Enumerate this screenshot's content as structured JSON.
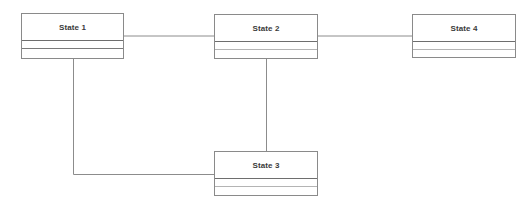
{
  "diagram": {
    "type": "state-diagram",
    "colors": {
      "border": "#8a8a8a",
      "connector": "#8c8c8c",
      "title_text": "#3a3a3a",
      "background": "#ffffff"
    },
    "states": [
      {
        "id": "state1",
        "label": "State 1",
        "x": 21,
        "y": 13,
        "w": 103,
        "h": 46
      },
      {
        "id": "state2",
        "label": "State 2",
        "x": 214,
        "y": 14,
        "w": 104,
        "h": 45
      },
      {
        "id": "state3",
        "label": "State 3",
        "x": 214,
        "y": 151,
        "w": 104,
        "h": 45
      },
      {
        "id": "state4",
        "label": "State 4",
        "x": 412,
        "y": 14,
        "w": 104,
        "h": 44
      }
    ],
    "connections": [
      {
        "from": "State 1",
        "to": "State 2"
      },
      {
        "from": "State 2",
        "to": "State 4"
      },
      {
        "from": "State 2",
        "to": "State 3"
      },
      {
        "from": "State 1",
        "to": "State 3"
      }
    ]
  }
}
